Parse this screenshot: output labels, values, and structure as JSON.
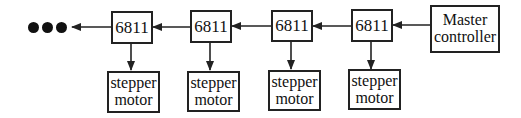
{
  "diagram": {
    "type": "block-diagram",
    "master": {
      "line1": "Master",
      "line2": "controller"
    },
    "controllers": [
      {
        "label": "6811"
      },
      {
        "label": "6811"
      },
      {
        "label": "6811"
      },
      {
        "label": "6811"
      }
    ],
    "motors": [
      {
        "line1": "stepper",
        "line2": "motor"
      },
      {
        "line1": "stepper",
        "line2": "motor"
      },
      {
        "line1": "stepper",
        "line2": "motor"
      },
      {
        "line1": "stepper",
        "line2": "motor"
      }
    ],
    "continuation": "ellipsis-dots",
    "connections": [
      {
        "from": "Master controller",
        "to": "6811 #4"
      },
      {
        "from": "6811 #4",
        "to": "6811 #3"
      },
      {
        "from": "6811 #3",
        "to": "6811 #2"
      },
      {
        "from": "6811 #2",
        "to": "6811 #1"
      },
      {
        "from": "6811 #1",
        "to": "ellipsis"
      },
      {
        "from": "6811 #1",
        "to": "stepper motor #1"
      },
      {
        "from": "6811 #2",
        "to": "stepper motor #2"
      },
      {
        "from": "6811 #3",
        "to": "stepper motor #3"
      },
      {
        "from": "6811 #4",
        "to": "stepper motor #4"
      }
    ],
    "colors": {
      "line": "#222222",
      "background": "#ffffff"
    }
  }
}
